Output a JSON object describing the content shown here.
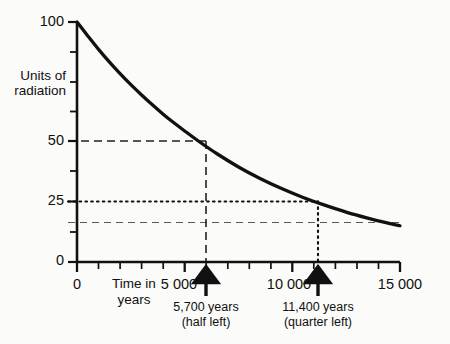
{
  "chart_data": {
    "type": "line",
    "title": "",
    "subtitle": "",
    "xlabel": "Time in\nyears",
    "ylabel": "Units of\nradiation",
    "xlim": [
      0,
      15000
    ],
    "ylim": [
      0,
      100
    ],
    "grid": false,
    "legend": null,
    "x_tick_labels": [
      "0",
      "5 000",
      "10 000",
      "15 000"
    ],
    "x_tick_values": [
      0,
      5000,
      10000,
      15000
    ],
    "x_minor_step": 1000,
    "y_tick_labels": [
      "100",
      "50",
      "25",
      "0"
    ],
    "y_tick_values": [
      100,
      50,
      25,
      0
    ],
    "y_minor_values": [
      87.5,
      75,
      62.5,
      37.5,
      12.5
    ],
    "series": [
      {
        "name": "radiation remaining",
        "half_life": 5700,
        "initial_value": 100,
        "x": [
          0,
          500,
          1000,
          1500,
          2000,
          2500,
          3000,
          3500,
          4000,
          4500,
          5000,
          5700,
          6500,
          7500,
          8500,
          9500,
          10500,
          11400,
          12500,
          13500,
          14500,
          15000
        ],
        "values": [
          100,
          94.2,
          88.6,
          83.4,
          78.5,
          73.9,
          69.6,
          65.5,
          61.6,
          58.0,
          54.6,
          50.0,
          45.1,
          39.6,
          34.8,
          30.6,
          26.9,
          24.0,
          20.8,
          18.3,
          16.1,
          15.1
        ]
      }
    ],
    "guides": [
      {
        "type": "horizontal",
        "value": 50,
        "style": "dashed",
        "to_x": 5700
      },
      {
        "type": "vertical",
        "value": 5700,
        "style": "dashed",
        "to_y": 50
      },
      {
        "type": "horizontal",
        "value": 25,
        "style": "dotted",
        "to_x": 11400
      },
      {
        "type": "vertical",
        "value": 11400,
        "style": "dotted",
        "to_y": 25
      },
      {
        "type": "horizontal",
        "value": 12.5,
        "style": "dashed-light",
        "to_x": 15000
      }
    ],
    "annotations": [
      {
        "x": 5700,
        "line1": "5,700 years",
        "line2": "(half left)",
        "marker": "up-arrow"
      },
      {
        "x": 11400,
        "line1": "11,400 years",
        "line2": "(quarter left)",
        "marker": "up-arrow"
      }
    ],
    "colors": {
      "curve": "#111111",
      "axis": "#111111",
      "guide": "#3a3a3a",
      "background": "#fbfbf9"
    }
  },
  "labels": {
    "y_100": "100",
    "y_50": "50",
    "y_25": "25",
    "y_0": "0",
    "x_0": "0",
    "x_5000": "5 000",
    "x_10000": "10 000",
    "x_15000": "15 000",
    "y_axis_line1": "Units of",
    "y_axis_line2": "radiation",
    "x_axis_line1": "Time in",
    "x_axis_line2": "years",
    "anno1_line1": "5,700 years",
    "anno1_line2": "(half left)",
    "anno2_line1": "11,400 years",
    "anno2_line2": "(quarter left)"
  }
}
